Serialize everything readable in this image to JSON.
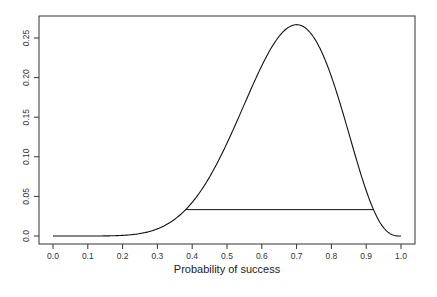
{
  "chart_data": {
    "type": "line",
    "title": "",
    "xlabel": "Probability of success",
    "ylabel": "",
    "xlim": [
      0.0,
      1.0
    ],
    "ylim": [
      0.0,
      0.27
    ],
    "grid": false,
    "x_ticks": [
      "0.0",
      "0.1",
      "0.2",
      "0.3",
      "0.4",
      "0.5",
      "0.6",
      "0.7",
      "0.8",
      "0.9",
      "1.0"
    ],
    "y_ticks": [
      "0.0",
      "0.05",
      "0.10",
      "0.15",
      "0.20",
      "0.25"
    ],
    "series": [
      {
        "name": "likelihood",
        "description": "Binomial probability of 7 successes in 10 trials as a function of p",
        "x": [
          0.0,
          0.05,
          0.1,
          0.15,
          0.2,
          0.25,
          0.3,
          0.35,
          0.4,
          0.45,
          0.5,
          0.55,
          0.6,
          0.65,
          0.7,
          0.75,
          0.8,
          0.85,
          0.9,
          0.95,
          1.0
        ],
        "values": [
          0.0,
          0.0,
          0.0,
          0.0001,
          0.0008,
          0.0031,
          0.009,
          0.0212,
          0.0425,
          0.0746,
          0.1172,
          0.1665,
          0.215,
          0.2522,
          0.2668,
          0.2503,
          0.2013,
          0.1298,
          0.0574,
          0.0105,
          0.0
        ]
      }
    ],
    "annotations": [
      {
        "type": "hline_segment",
        "y": 0.0333,
        "x_start": 0.382,
        "x_end": 0.921,
        "label": "1/8 likelihood interval"
      }
    ],
    "peak": {
      "x": 0.7,
      "y": 0.2668
    }
  }
}
